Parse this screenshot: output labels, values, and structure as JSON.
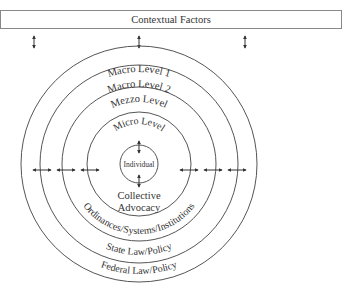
{
  "header": {
    "title": "Contextual Factors"
  },
  "levels": [
    {
      "name": "Macro Level 1",
      "bottom_label": "Federal Law/Policy"
    },
    {
      "name": "Macro Level 2",
      "bottom_label": "State Law/Policy"
    },
    {
      "name": "Mezzo Level",
      "bottom_label": "Ordinances/Systems/Institutions"
    },
    {
      "name": "Micro Level",
      "bottom_label_line1": "Collective",
      "bottom_label_line2": "Advocacy"
    }
  ],
  "center": {
    "label": "Individual"
  },
  "colors": {
    "line": "#555555",
    "text": "#333333",
    "background": "#ffffff"
  }
}
